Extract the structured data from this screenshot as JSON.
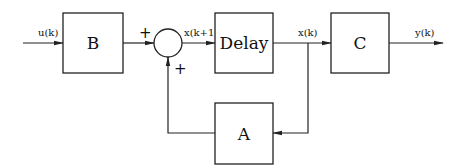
{
  "diagram": {
    "type": "block-diagram",
    "blocks": [
      {
        "id": "B",
        "label": "B"
      },
      {
        "id": "delay",
        "label": "Delay"
      },
      {
        "id": "C",
        "label": "C"
      },
      {
        "id": "A",
        "label": "A"
      }
    ],
    "summing_junction": {
      "signs": {
        "top": "+",
        "bottom": "+"
      }
    },
    "signals": {
      "input": "u(k)",
      "sum_output": "x(k+1)",
      "state": "x(k)",
      "output": "y(k)"
    },
    "connections": [
      {
        "from": "input",
        "to": "B",
        "label": "u(k)"
      },
      {
        "from": "B",
        "to": "summing_junction",
        "sign": "+"
      },
      {
        "from": "summing_junction",
        "to": "delay",
        "label": "x(k+1)"
      },
      {
        "from": "delay",
        "to": "C",
        "label": "x(k)"
      },
      {
        "from": "C",
        "to": "output",
        "label": "y(k)"
      },
      {
        "from": "delay",
        "to": "A",
        "label": "x(k)",
        "note": "feedback branch"
      },
      {
        "from": "A",
        "to": "summing_junction",
        "sign": "+"
      }
    ],
    "colors": {
      "line": "#222222",
      "background": "#ffffff"
    }
  }
}
